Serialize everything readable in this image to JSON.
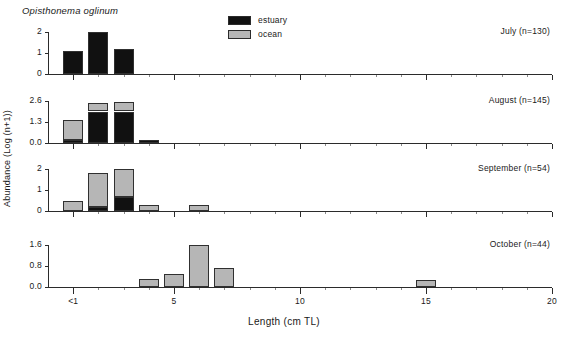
{
  "figure": {
    "species_title": "Opisthonema oglinum",
    "x_axis_title": "Length (cm TL)",
    "y_axis_title": "Abundance (Log (n+1))",
    "colors": {
      "estuary": "#111111",
      "ocean": "#b6b6b6",
      "axis": "#2b2b2b",
      "background": "#ffffff"
    }
  },
  "legend": {
    "position": "top-center",
    "entries": [
      {
        "label": "estuary",
        "swatch": "estuary-swatch",
        "color": "#111111"
      },
      {
        "label": "ocean",
        "swatch": "ocean-swatch",
        "color": "#b6b6b6"
      }
    ]
  },
  "chart_data": {
    "type": "bar",
    "title": "Opisthonema oglinum",
    "xlabel": "Length (cm TL)",
    "ylabel": "Abundance (Log (n+1))",
    "grid": false,
    "stacked": true,
    "xlim": [
      0,
      20
    ],
    "x_tick_labels": [
      "<1",
      "5",
      "10",
      "15",
      "20"
    ],
    "x_tick_values": [
      1,
      5,
      10,
      15,
      20
    ],
    "x_minor_tick_step": 1,
    "legend_entries": [
      "estuary",
      "ocean"
    ],
    "panels": [
      {
        "name": "July",
        "label": "July (n=130)",
        "n": 130,
        "ylim": [
          0,
          2
        ],
        "y_tick_labels": [
          "0",
          "1",
          "2"
        ],
        "y_tick_values": [
          0,
          1,
          2
        ],
        "x": [
          1,
          2,
          3
        ],
        "series": [
          {
            "name": "estuary",
            "values": [
              1.1,
              2.0,
              1.2
            ]
          },
          {
            "name": "ocean",
            "values": [
              0,
              0,
              0
            ]
          }
        ]
      },
      {
        "name": "August",
        "label": "August (n=145)",
        "n": 145,
        "ylim": [
          0,
          2.6
        ],
        "y_tick_labels": [
          "0.0",
          "1.3",
          "2.6"
        ],
        "y_tick_values": [
          0.0,
          1.3,
          2.6
        ],
        "x": [
          1,
          2,
          3,
          4
        ],
        "series": [
          {
            "name": "estuary",
            "values": [
              0.2,
              1.95,
              1.95,
              0.16
            ]
          },
          {
            "name": "ocean",
            "values": [
              1.2,
              0.55,
              0.6,
              0
            ]
          }
        ]
      },
      {
        "name": "September",
        "label": "September (n=54)",
        "n": 54,
        "ylim": [
          0,
          2
        ],
        "y_tick_labels": [
          "0",
          "1",
          "2"
        ],
        "y_tick_values": [
          0,
          1,
          2
        ],
        "x": [
          1,
          2,
          3,
          4,
          6
        ],
        "series": [
          {
            "name": "estuary",
            "values": [
              0,
              0.2,
              0.68,
              0,
              0
            ]
          },
          {
            "name": "ocean",
            "values": [
              0.48,
              1.6,
              1.32,
              0.28,
              0.27
            ]
          }
        ]
      },
      {
        "name": "October",
        "label": "October (n=44)",
        "n": 44,
        "ylim": [
          0,
          1.6
        ],
        "y_tick_labels": [
          "0.0",
          "0.8",
          "1.6"
        ],
        "y_tick_values": [
          0.0,
          0.8,
          1.6
        ],
        "x": [
          4,
          5,
          6,
          7,
          15
        ],
        "series": [
          {
            "name": "estuary",
            "values": [
              0,
              0,
              0,
              0,
              0
            ]
          },
          {
            "name": "ocean",
            "values": [
              0.3,
              0.48,
              1.6,
              0.72,
              0.28
            ]
          }
        ]
      }
    ]
  }
}
